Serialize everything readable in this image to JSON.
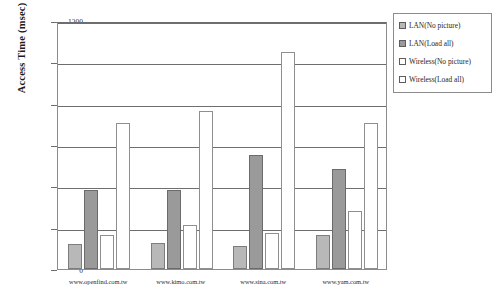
{
  "chart_data": {
    "type": "bar",
    "title": "",
    "subtitle": "",
    "xlabel": "",
    "ylabel": "Access Time (msec)",
    "ylim": [
      0,
      1200
    ],
    "yticks": [
      0,
      200,
      400,
      600,
      800,
      1000,
      1200
    ],
    "ytick_labels": [
      "0",
      "200",
      "400",
      "600",
      "800",
      "1000",
      "1200"
    ],
    "grid": true,
    "legend_position": "right",
    "categories": [
      "www.openfind.com.tw",
      "www.kimo.com.tw",
      "www.sina.com.tw",
      "www.yam.com.tw"
    ],
    "series": [
      {
        "name": "LAN(No picture)",
        "values": [
          120,
          125,
          110,
          165
        ]
      },
      {
        "name": "LAN(Load all)",
        "values": [
          380,
          380,
          550,
          485
        ]
      },
      {
        "name": "Wireless(No picture)",
        "values": [
          165,
          215,
          175,
          280
        ]
      },
      {
        "name": "Wireless(Load all)",
        "values": [
          705,
          765,
          1050,
          705
        ]
      }
    ],
    "colors": [
      "#b8b8b8",
      "#9a9a9a",
      "#ffffff",
      "#ffffff"
    ],
    "edge_color": "#6e6e6e",
    "plot_background": "#ffffff"
  },
  "legend": {
    "items": [
      {
        "label": "LAN(No picture)"
      },
      {
        "label": "LAN(Load all)"
      },
      {
        "label": "Wireless(No picture)"
      },
      {
        "label": "Wireless(Load all)"
      }
    ]
  }
}
